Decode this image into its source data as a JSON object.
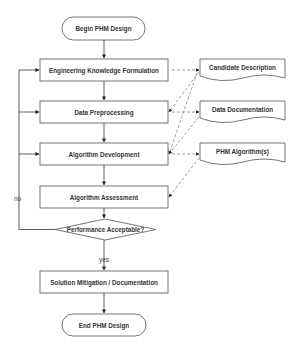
{
  "diagram": {
    "type": "flowchart",
    "colors": {
      "stroke": "#555555",
      "text": "#333333",
      "background": "#ffffff"
    },
    "nodes": {
      "begin": "Begin PHM Design",
      "engineering": "Engineering Knowledge Formulation",
      "preprocessing": "Data Preprocessing",
      "development": "Algorithm Development",
      "assessment": "Algorithm Assessment",
      "decision": "Performance Acceptable?",
      "solution": "Solution Mitigation / Documentation",
      "end": "End PHM Design"
    },
    "documents": {
      "candidate": "Candidate Description",
      "data_doc": "Data Documentation",
      "algorithm": "PHM Algorithm(s)"
    },
    "edge_labels": {
      "no": "no",
      "yes": "yes"
    }
  }
}
